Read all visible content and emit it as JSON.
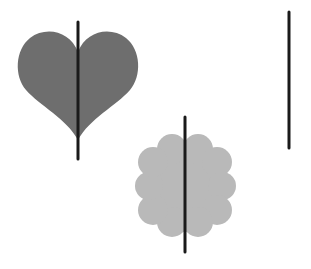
{
  "figure": {
    "width": 311,
    "height": 269,
    "background": "#ffffff",
    "shapes": [
      {
        "name": "heart",
        "fill": "#6e6e6e",
        "bbox": {
          "x": 17,
          "y": 31,
          "w": 126,
          "h": 109
        }
      },
      {
        "name": "scalloped-flower",
        "fill": "#b9b9b9",
        "bbox": {
          "x": 135,
          "y": 134,
          "w": 101,
          "h": 103
        }
      }
    ],
    "lines": [
      {
        "name": "heart-symmetry-line",
        "x": 78,
        "y1": 22,
        "y2": 159,
        "color": "#1a1a1a",
        "width": 3
      },
      {
        "name": "flower-symmetry-line",
        "x": 185,
        "y1": 117,
        "y2": 252,
        "color": "#1a1a1a",
        "width": 3
      },
      {
        "name": "standalone-line",
        "x": 289,
        "y1": 12,
        "y2": 148,
        "color": "#1a1a1a",
        "width": 3
      }
    ]
  }
}
